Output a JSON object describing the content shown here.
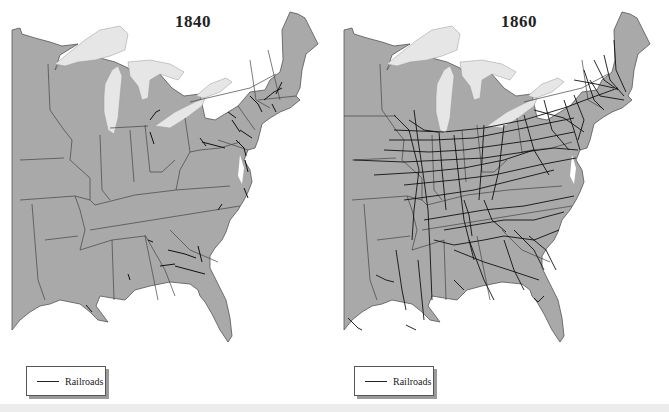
{
  "maps": [
    {
      "title": "1840",
      "legend": {
        "label": "Railroads",
        "symbol": "line"
      }
    },
    {
      "title": "1860",
      "legend": {
        "label": "Railroads",
        "symbol": "line"
      }
    }
  ],
  "colors": {
    "land": "#a9a9a9",
    "lakes": "#e6e6e6",
    "water": "#ffffff",
    "borders": "#444444",
    "railroads": "#111111"
  }
}
